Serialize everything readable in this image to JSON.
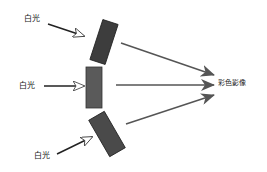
{
  "diagram": {
    "input_labels": [
      "白光",
      "白光",
      "白光"
    ],
    "output_label": "彩色影像",
    "colors": {
      "panel_top": "#3d3d3d",
      "panel_middle": "#5a5a5a",
      "panel_bottom": "#4a4a4a",
      "arrow": "#555555",
      "input_arrow": "#222222"
    }
  }
}
